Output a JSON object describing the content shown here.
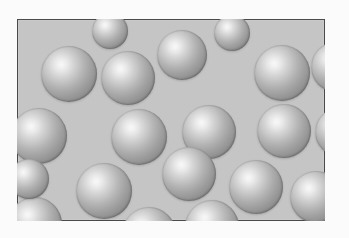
{
  "figure": {
    "kind": "sphere-packing-diagram",
    "caption": "",
    "panel": {
      "x": 17,
      "y": 19,
      "width": 308,
      "height": 202,
      "background_color": "#c6c6c6",
      "border_color": "#4a4a4a",
      "border_width": 1
    },
    "outer_background_color": "#fbfbfb",
    "sphere_style": {
      "highlight_color": "#ffffff",
      "mid_color": "#b4b4b4",
      "edge_color": "#7d7d7d",
      "highlight_position": "36% 33%",
      "count_visible": 24
    },
    "spheres": [
      {
        "cx": 52,
        "cy": 55,
        "r": 28
      },
      {
        "cx": 111,
        "cy": 59,
        "r": 27
      },
      {
        "cx": 165,
        "cy": 36,
        "r": 25
      },
      {
        "cx": 265,
        "cy": 54,
        "r": 28
      },
      {
        "cx": 319,
        "cy": 48,
        "r": 25
      },
      {
        "cx": 22,
        "cy": 117,
        "r": 28
      },
      {
        "cx": 122,
        "cy": 118,
        "r": 28
      },
      {
        "cx": 192,
        "cy": 113,
        "r": 27
      },
      {
        "cx": 267,
        "cy": 112,
        "r": 27
      },
      {
        "cx": 322,
        "cy": 113,
        "r": 24
      },
      {
        "cx": 87,
        "cy": 172,
        "r": 28
      },
      {
        "cx": 172,
        "cy": 155,
        "r": 27
      },
      {
        "cx": 239,
        "cy": 168,
        "r": 27
      },
      {
        "cx": 299,
        "cy": 178,
        "r": 26
      },
      {
        "cx": 18,
        "cy": 205,
        "r": 27
      },
      {
        "cx": 132,
        "cy": 215,
        "r": 27
      },
      {
        "cx": 195,
        "cy": 208,
        "r": 27
      },
      {
        "cx": 330,
        "cy": 150,
        "r": 22
      },
      {
        "cx": 58,
        "cy": 228,
        "r": 24
      },
      {
        "cx": 255,
        "cy": 232,
        "r": 24
      },
      {
        "cx": 12,
        "cy": 160,
        "r": 20
      },
      {
        "cx": 215,
        "cy": 14,
        "r": 18
      },
      {
        "cx": 93,
        "cy": 12,
        "r": 18
      },
      {
        "cx": 308,
        "cy": 228,
        "r": 20
      }
    ]
  }
}
